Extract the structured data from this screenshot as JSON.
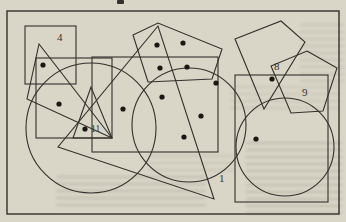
{
  "page": {
    "background_color": "#d9d5c7",
    "line_color": "#33312c",
    "dot_color": "#191813"
  },
  "figure": {
    "frame": {
      "x": 7,
      "y": 11,
      "w": 332,
      "h": 203
    },
    "top_partial_character": {
      "x": 117,
      "y": 0,
      "w": 7,
      "h": 4
    },
    "shapes": [
      {
        "kind": "rect",
        "name": "square-4",
        "x": 25,
        "y": 26,
        "w": 51,
        "h": 58
      },
      {
        "kind": "rect",
        "name": "left-rectangle",
        "x": 36,
        "y": 58,
        "w": 76,
        "h": 80
      },
      {
        "kind": "polygon",
        "name": "left-triangle",
        "points": "39,44 27,99 112,138"
      },
      {
        "kind": "circle",
        "name": "left-circle",
        "cx": 91,
        "cy": 128,
        "r": 65
      },
      {
        "kind": "rect",
        "name": "middle-rectangle",
        "x": 92,
        "y": 57,
        "w": 126,
        "h": 95
      },
      {
        "kind": "polygon",
        "name": "top-pentagon",
        "points": "133,35 158,23 222,49 212,79 148,82"
      },
      {
        "kind": "circle",
        "name": "middle-circle",
        "cx": 189,
        "cy": 125,
        "r": 57
      },
      {
        "kind": "polygon",
        "name": "large-triangle-1",
        "points": "158,26 58,147 214,199"
      },
      {
        "kind": "polygon",
        "name": "small-triangle-11",
        "points": "91,87 73,138 112,138"
      },
      {
        "kind": "polygon",
        "name": "top-right-quadrilateral",
        "points": "235,39 281,21 305,42 264,109"
      },
      {
        "kind": "polygon",
        "name": "right-pentagon-9",
        "points": "307,51 337,68 323,111 291,113 271,66"
      },
      {
        "kind": "rect",
        "name": "right-rectangle",
        "x": 235,
        "y": 75,
        "w": 93,
        "h": 127
      },
      {
        "kind": "circle",
        "name": "right-circle",
        "cx": 285,
        "cy": 147,
        "r": 49
      }
    ],
    "dots": [
      [
        43,
        65
      ],
      [
        59,
        104
      ],
      [
        85,
        129
      ],
      [
        123,
        109
      ],
      [
        157,
        45
      ],
      [
        183,
        43
      ],
      [
        160,
        68
      ],
      [
        187,
        67
      ],
      [
        162,
        97
      ],
      [
        201,
        116
      ],
      [
        184,
        137
      ],
      [
        216,
        83
      ],
      [
        272,
        79
      ],
      [
        256,
        139
      ]
    ],
    "dot_radius": 2.6,
    "labels": [
      {
        "text": "4",
        "x": 57,
        "y": 41,
        "size": 11
      },
      {
        "text": "11",
        "x": 91,
        "y": 132,
        "size": 9.5
      },
      {
        "text": "8",
        "x": 274,
        "y": 70,
        "size": 11
      },
      {
        "text": "9",
        "x": 302,
        "y": 96,
        "size": 11
      },
      {
        "text": "1",
        "x": 219,
        "y": 182,
        "size": 11
      }
    ]
  }
}
